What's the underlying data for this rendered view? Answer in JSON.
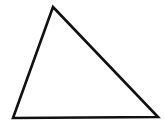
{
  "canvas": {
    "width": 164,
    "height": 125,
    "background_color": "#ffffff",
    "name": "triangle-figure"
  },
  "figure": {
    "shape": "triangle",
    "stroke_color": "#111111",
    "fill_color": "none",
    "stroke_width": 2.6,
    "vertices": [
      {
        "label": "apex",
        "x": 53,
        "y": 7
      },
      {
        "label": "bottom-right",
        "x": 158,
        "y": 117
      },
      {
        "label": "bottom-left",
        "x": 13,
        "y": 118
      }
    ],
    "points_attr": "53,7 158,117 13,118"
  }
}
